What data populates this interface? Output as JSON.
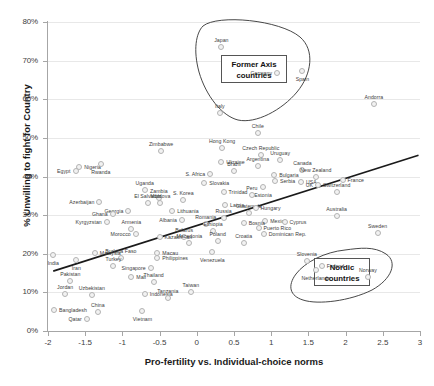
{
  "chart_data": {
    "type": "scatter",
    "title": "",
    "xlabel": "Pro-fertility vs. Individual-choice norms",
    "ylabel": "% Unwilling to fight for Country",
    "xlim": [
      -2,
      3
    ],
    "ylim": [
      0,
      0.8
    ],
    "xticks": [
      "-2",
      "-1.5",
      "-1",
      "-0.5",
      "0",
      "0.5",
      "1",
      "1.5",
      "2",
      "2.5",
      "3"
    ],
    "yticks": [
      "0%",
      "10%",
      "20%",
      "30%",
      "40%",
      "50%",
      "60%",
      "70%",
      "80%"
    ],
    "grid": true,
    "legend": "none",
    "trendline": {
      "x0": -1.93,
      "y0": 0.155,
      "x1": 2.98,
      "y1": 0.455
    },
    "annotations": [
      {
        "text": "Former Axis countries",
        "x": 0.18,
        "y": 0.665
      },
      {
        "text": "Nordic countries",
        "x": 2.02,
        "y": 0.205
      }
    ],
    "points": [
      {
        "label": "Japan",
        "x": 0.33,
        "y": 0.735,
        "pos": "t"
      },
      {
        "label": "Germany",
        "x": 1.08,
        "y": 0.668,
        "pos": "r"
      },
      {
        "label": "Spain",
        "x": 1.42,
        "y": 0.672,
        "pos": "b"
      },
      {
        "label": "Andorra",
        "x": 2.38,
        "y": 0.588,
        "pos": "t"
      },
      {
        "label": "Italy",
        "x": 0.31,
        "y": 0.565,
        "pos": "t"
      },
      {
        "label": "Chile",
        "x": 0.82,
        "y": 0.513,
        "pos": "t"
      },
      {
        "label": "Czech Republic",
        "x": 0.86,
        "y": 0.455,
        "pos": "t"
      },
      {
        "label": "Hong Kong",
        "x": 0.34,
        "y": 0.475,
        "pos": "t"
      },
      {
        "label": "Zimbabwe",
        "x": -0.48,
        "y": 0.467,
        "pos": "t"
      },
      {
        "label": "Uruguay",
        "x": 1.12,
        "y": 0.442,
        "pos": "t"
      },
      {
        "label": "Ukraine",
        "x": 0.33,
        "y": 0.437,
        "pos": "l"
      },
      {
        "label": "Argentina",
        "x": 0.82,
        "y": 0.427,
        "pos": "t"
      },
      {
        "label": "Nigeria",
        "x": -1.58,
        "y": 0.425,
        "pos": "l"
      },
      {
        "label": "Rwanda",
        "x": -1.29,
        "y": 0.433,
        "pos": "b"
      },
      {
        "label": "Canada",
        "x": 1.42,
        "y": 0.418,
        "pos": "t"
      },
      {
        "label": "Egypt",
        "x": -1.63,
        "y": 0.413,
        "pos": "r"
      },
      {
        "label": "S. Africa",
        "x": 0.18,
        "y": 0.407,
        "pos": "r"
      },
      {
        "label": "Brazil",
        "x": 0.5,
        "y": 0.413,
        "pos": "t"
      },
      {
        "label": "Bulgaria",
        "x": 1.04,
        "y": 0.404,
        "pos": "l"
      },
      {
        "label": "New Zealand",
        "x": 1.6,
        "y": 0.399,
        "pos": "t"
      },
      {
        "label": "France",
        "x": 1.96,
        "y": 0.391,
        "pos": "l"
      },
      {
        "label": "USA",
        "x": 1.4,
        "y": 0.385,
        "pos": "l"
      },
      {
        "label": "Serbia",
        "x": 1.05,
        "y": 0.389,
        "pos": "l"
      },
      {
        "label": "Slovakia",
        "x": 0.1,
        "y": 0.383,
        "pos": "l"
      },
      {
        "label": "UK",
        "x": 1.63,
        "y": 0.378,
        "pos": "r"
      },
      {
        "label": "Estonia",
        "x": 0.89,
        "y": 0.374,
        "pos": "b"
      },
      {
        "label": "Switzerland",
        "x": 1.88,
        "y": 0.361,
        "pos": "t"
      },
      {
        "label": "Uganda",
        "x": -0.7,
        "y": 0.366,
        "pos": "t"
      },
      {
        "label": "Trinidad",
        "x": 0.36,
        "y": 0.36,
        "pos": "l"
      },
      {
        "label": "Peru",
        "x": 0.74,
        "y": 0.352,
        "pos": "t"
      },
      {
        "label": "Zambia",
        "x": -0.51,
        "y": 0.345,
        "pos": "t"
      },
      {
        "label": "S. Korea",
        "x": -0.18,
        "y": 0.34,
        "pos": "t"
      },
      {
        "label": "Azerbaijan",
        "x": -1.31,
        "y": 0.333,
        "pos": "r"
      },
      {
        "label": "El Salvador",
        "x": -0.66,
        "y": 0.332,
        "pos": "t"
      },
      {
        "label": "Moldova",
        "x": -0.49,
        "y": 0.331,
        "pos": "t"
      },
      {
        "label": "Latvia",
        "x": 0.38,
        "y": 0.326,
        "pos": "l"
      },
      {
        "label": "Georgia",
        "x": -0.92,
        "y": 0.31,
        "pos": "r"
      },
      {
        "label": "Ghana",
        "x": -1.13,
        "y": 0.303,
        "pos": "r"
      },
      {
        "label": "Lithuania",
        "x": -0.33,
        "y": 0.31,
        "pos": "l"
      },
      {
        "label": "Guatemala",
        "x": 0.7,
        "y": 0.305,
        "pos": "t"
      },
      {
        "label": "Hungary",
        "x": 0.79,
        "y": 0.318,
        "pos": "l"
      },
      {
        "label": "Australia",
        "x": 1.88,
        "y": 0.298,
        "pos": "t"
      },
      {
        "label": "Russia",
        "x": 0.36,
        "y": 0.293,
        "pos": "t"
      },
      {
        "label": "Albania",
        "x": -0.2,
        "y": 0.288,
        "pos": "r"
      },
      {
        "label": "Mexico",
        "x": 0.92,
        "y": 0.285,
        "pos": "l"
      },
      {
        "label": "Kyrgyzstan",
        "x": -1.21,
        "y": 0.282,
        "pos": "r"
      },
      {
        "label": "Romania",
        "x": 0.12,
        "y": 0.277,
        "pos": "t"
      },
      {
        "label": "Bosnia",
        "x": 0.63,
        "y": 0.279,
        "pos": "l"
      },
      {
        "label": "Cyprus",
        "x": 1.18,
        "y": 0.281,
        "pos": "l"
      },
      {
        "label": "Armenia",
        "x": -0.88,
        "y": 0.265,
        "pos": "t"
      },
      {
        "label": "Sweden",
        "x": 2.43,
        "y": 0.253,
        "pos": "t"
      },
      {
        "label": "Puerto Rico",
        "x": 0.83,
        "y": 0.266,
        "pos": "l"
      },
      {
        "label": "Ethiopia",
        "x": 0.22,
        "y": 0.26,
        "pos": "t"
      },
      {
        "label": "Morocco",
        "x": -0.82,
        "y": 0.25,
        "pos": "r"
      },
      {
        "label": "Kazakhstan",
        "x": -0.5,
        "y": 0.243,
        "pos": "l"
      },
      {
        "label": "Belarus",
        "x": -0.17,
        "y": 0.244,
        "pos": "t"
      },
      {
        "label": "Dominican Rep.",
        "x": 0.9,
        "y": 0.25,
        "pos": "l"
      },
      {
        "label": "Macedonia",
        "x": -0.1,
        "y": 0.228,
        "pos": "t"
      },
      {
        "label": "Poland",
        "x": 0.28,
        "y": 0.232,
        "pos": "t"
      },
      {
        "label": "Croatia",
        "x": 0.63,
        "y": 0.228,
        "pos": "t"
      },
      {
        "label": "India",
        "x": -1.93,
        "y": 0.198,
        "pos": "b"
      },
      {
        "label": "Malaysia",
        "x": -1.37,
        "y": 0.201,
        "pos": "l"
      },
      {
        "label": "Macau",
        "x": -0.53,
        "y": 0.202,
        "pos": "l"
      },
      {
        "label": "Iran",
        "x": -1.62,
        "y": 0.183,
        "pos": "b"
      },
      {
        "label": "Venezuela",
        "x": 0.21,
        "y": 0.204,
        "pos": "b"
      },
      {
        "label": "Burkina Faso",
        "x": -1.02,
        "y": 0.188,
        "pos": "t"
      },
      {
        "label": "Philippines",
        "x": -0.53,
        "y": 0.188,
        "pos": "l"
      },
      {
        "label": "Slovenia",
        "x": 1.48,
        "y": 0.18,
        "pos": "t"
      },
      {
        "label": "Finland",
        "x": 1.68,
        "y": 0.168,
        "pos": "l"
      },
      {
        "label": "Netherlands",
        "x": 1.6,
        "y": 0.157,
        "pos": "b"
      },
      {
        "label": "Turkey",
        "x": -1.12,
        "y": 0.168,
        "pos": "t"
      },
      {
        "label": "Singapore",
        "x": -0.62,
        "y": 0.162,
        "pos": "r"
      },
      {
        "label": "Norway",
        "x": 2.3,
        "y": 0.14,
        "pos": "t"
      },
      {
        "label": "Pakistan",
        "x": -1.7,
        "y": 0.13,
        "pos": "t"
      },
      {
        "label": "Mali",
        "x": -0.88,
        "y": 0.14,
        "pos": "l"
      },
      {
        "label": "Thailand",
        "x": -0.58,
        "y": 0.128,
        "pos": "t"
      },
      {
        "label": "Taiwan",
        "x": -0.08,
        "y": 0.102,
        "pos": "t"
      },
      {
        "label": "Jordan",
        "x": -1.77,
        "y": 0.095,
        "pos": "t"
      },
      {
        "label": "Uzbekistan",
        "x": -1.41,
        "y": 0.092,
        "pos": "t"
      },
      {
        "label": "Indonesia",
        "x": -0.7,
        "y": 0.097,
        "pos": "l"
      },
      {
        "label": "Tanzania",
        "x": -0.39,
        "y": 0.085,
        "pos": "t"
      },
      {
        "label": "Bangladesh",
        "x": -1.92,
        "y": 0.055,
        "pos": "l"
      },
      {
        "label": "China",
        "x": -1.33,
        "y": 0.048,
        "pos": "t"
      },
      {
        "label": "Vietnam",
        "x": -0.73,
        "y": 0.053,
        "pos": "b"
      },
      {
        "label": "Qatar",
        "x": -1.48,
        "y": 0.032,
        "pos": "r"
      }
    ]
  }
}
